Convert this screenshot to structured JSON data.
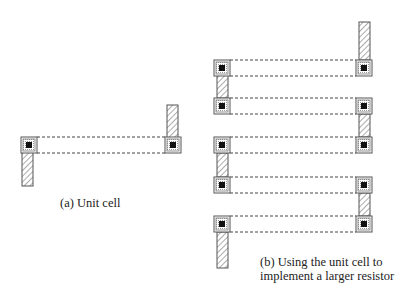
{
  "captions": {
    "a": "(a) Unit cell",
    "b_line1": "(b) Using the unit cell to",
    "b_line2": "implement a larger resistor"
  },
  "colors": {
    "stroke": "#555555",
    "hatch": "#666666",
    "contact_fill": "#111111",
    "dash": "#444444"
  },
  "diagram": {
    "unit_cell": {
      "contacts": [
        {
          "x": 21,
          "y": 137
        },
        {
          "x": 165,
          "y": 137
        }
      ],
      "strips": [
        {
          "x": 22,
          "y": 152,
          "w": 11,
          "h": 34
        },
        {
          "x": 167,
          "y": 105,
          "w": 11,
          "h": 33
        }
      ]
    },
    "large_resistor": {
      "rows": [
        60,
        98,
        137,
        177,
        216
      ],
      "left_x": 214,
      "right_x": 356
    }
  }
}
